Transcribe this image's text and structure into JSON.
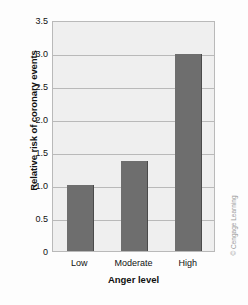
{
  "chart_data": {
    "type": "bar",
    "title": "",
    "subtitle": "",
    "xlabel": "Anger level",
    "ylabel": "Relative risk of coronary events",
    "categories": [
      "Low",
      "Moderate",
      "High"
    ],
    "values": [
      1.0,
      1.37,
      2.98
    ],
    "series": [
      {
        "name": "Relative risk of coronary events",
        "values": [
          1.0,
          1.37,
          2.98
        ]
      }
    ],
    "ylim": [
      0,
      3.5
    ],
    "yticks": [
      "0",
      "0.5",
      "1.0",
      "1.5",
      "2.0",
      "2.5",
      "3.0",
      "3.5"
    ],
    "ytick_values": [
      0,
      0.5,
      1.0,
      1.5,
      2.0,
      2.5,
      3.0,
      3.5
    ],
    "grid": true,
    "grid_axis": "y",
    "legend": false,
    "legend_position": "none",
    "bar_color": "#6e6e6e",
    "plot_background": "#efefef",
    "grid_color": "#b9b9b9",
    "axis_text_color": "#111111"
  },
  "credit": {
    "text": "© Cengage Learning",
    "color": "#9a9a9a"
  }
}
